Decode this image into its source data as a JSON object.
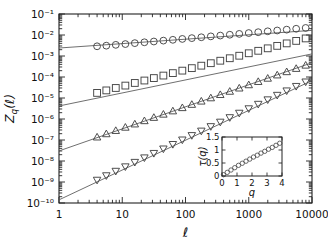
{
  "figure": {
    "background": "#ffffff",
    "line_color": "#555555",
    "marker_color": "#444444",
    "axis_color": "#222222"
  },
  "chart_data": {
    "type": "line",
    "title": "",
    "xlabel": "ℓ",
    "ylabel": "Z_q(ℓ)",
    "xscale": "log",
    "yscale": "log",
    "xlim": [
      1,
      10000
    ],
    "ylim": [
      1e-10,
      0.1
    ],
    "grid": false,
    "legend": "none",
    "xticklabels": [
      "1",
      "10",
      "100",
      "1000",
      "10000"
    ],
    "xtickvalues": [
      1,
      10,
      100,
      1000,
      10000
    ],
    "yticklabels": [
      "10⁻¹",
      "10⁻²",
      "10⁻³",
      "10⁻⁴",
      "10⁻⁵",
      "10⁻⁶",
      "10⁻⁷",
      "10⁻⁸",
      "10⁻⁹",
      "10⁻¹⁰"
    ],
    "ytickvalues": [
      0.1,
      0.01,
      0.001,
      0.0001,
      1e-05,
      1e-06,
      1e-07,
      1e-08,
      1e-09,
      1e-10
    ],
    "series": [
      {
        "name": "q = 1",
        "marker": "circle",
        "fit_intercept_log10": -2.62,
        "fit_slope": 0.21,
        "x": [
          4.0,
          5.6,
          7.9,
          11.2,
          15.8,
          22.4,
          31.6,
          44.7,
          63.1,
          89.1,
          125.9,
          177.8,
          251.2,
          354.8,
          501.2,
          707.9,
          1000.0,
          1412.5,
          1995.3,
          2818.4,
          3981.1,
          5623.4,
          7943.3
        ],
        "y": [
          0.0029,
          0.0031,
          0.0034,
          0.0037,
          0.0041,
          0.0045,
          0.0049,
          0.0054,
          0.0059,
          0.0065,
          0.0071,
          0.0078,
          0.0086,
          0.0094,
          0.0103,
          0.0113,
          0.0124,
          0.0136,
          0.015,
          0.0164,
          0.018,
          0.0198,
          0.0217
        ]
      },
      {
        "name": "q = 2",
        "marker": "square",
        "fit_intercept_log10": -5.38,
        "fit_slope": 0.62,
        "x": [
          4.0,
          5.6,
          7.9,
          11.2,
          15.8,
          22.4,
          31.6,
          44.7,
          63.1,
          89.1,
          125.9,
          177.8,
          251.2,
          354.8,
          501.2,
          707.9,
          1000.0,
          1412.5,
          1995.3,
          2818.4,
          3981.1,
          5623.4,
          7943.3
        ],
        "y": [
          1.75e-05,
          2.3e-05,
          3e-05,
          3.9e-05,
          5.2e-05,
          6.8e-05,
          8.9e-05,
          0.000117,
          0.000153,
          0.000201,
          0.000264,
          0.000346,
          0.000454,
          0.000596,
          0.000782,
          0.00103,
          0.00135,
          0.00177,
          0.00232,
          0.00304,
          0.00399,
          0.00524,
          0.00687
        ]
      },
      {
        "name": "q = 3",
        "marker": "triangle-up",
        "fit_intercept_log10": -7.52,
        "fit_slope": 1.05,
        "x": [
          4.0,
          5.6,
          7.9,
          11.2,
          15.8,
          22.4,
          31.6,
          44.7,
          63.1,
          89.1,
          125.9,
          177.8,
          251.2,
          354.8,
          501.2,
          707.9,
          1000.0,
          1412.5,
          1995.3,
          2818.4,
          3981.1,
          5623.4,
          7943.3
        ],
        "y": [
          1.35e-07,
          1.93e-07,
          2.76e-07,
          3.95e-07,
          5.65e-07,
          8.08e-07,
          1.16e-06,
          1.65e-06,
          2.37e-06,
          3.38e-06,
          4.84e-06,
          6.93e-06,
          9.91e-06,
          1.42e-05,
          2.03e-05,
          2.9e-05,
          4.15e-05,
          5.94e-05,
          8.5e-05,
          0.000122,
          0.000174,
          0.000249,
          0.000356
        ]
      },
      {
        "name": "q = 4",
        "marker": "triangle-down",
        "fit_intercept_log10": -9.85,
        "fit_slope": 1.42,
        "x": [
          4.0,
          5.6,
          7.9,
          11.2,
          15.8,
          22.4,
          31.6,
          44.7,
          63.1,
          89.1,
          125.9,
          177.8,
          251.2,
          354.8,
          501.2,
          707.9,
          1000.0,
          1412.5,
          1995.3,
          2818.4,
          3981.1,
          5623.4,
          7943.3
        ],
        "y": [
          1.25e-09,
          2.04e-09,
          3.33e-09,
          5.43e-09,
          8.86e-09,
          1.45e-08,
          2.36e-08,
          3.85e-08,
          6.29e-08,
          1.03e-07,
          1.67e-07,
          2.73e-07,
          4.46e-07,
          7.28e-07,
          1.19e-06,
          1.94e-06,
          3.16e-06,
          5.16e-06,
          8.42e-06,
          1.38e-05,
          2.24e-05,
          3.66e-05,
          5.97e-05
        ]
      }
    ],
    "inset": {
      "type": "scatter",
      "xlabel": "q",
      "ylabel": "τ(q)",
      "xlim": [
        0,
        4
      ],
      "ylim": [
        0,
        1.5
      ],
      "xticklabels": [
        "0",
        "1",
        "2",
        "3",
        "4"
      ],
      "xtickvalues": [
        0,
        1,
        2,
        3,
        4
      ],
      "yticklabels": [
        "0",
        "0.5",
        "1",
        "1.5"
      ],
      "ytickvalues": [
        0,
        0.5,
        1,
        1.5
      ],
      "marker": "circle",
      "x": [
        0.1,
        0.35,
        0.6,
        0.85,
        1.1,
        1.35,
        1.6,
        1.85,
        2.1,
        2.35,
        2.6,
        2.85,
        3.1,
        3.35,
        3.6,
        3.85
      ],
      "y": [
        0.05,
        0.14,
        0.23,
        0.32,
        0.41,
        0.49,
        0.57,
        0.65,
        0.73,
        0.8,
        0.88,
        0.95,
        1.03,
        1.1,
        1.18,
        1.26
      ]
    }
  }
}
